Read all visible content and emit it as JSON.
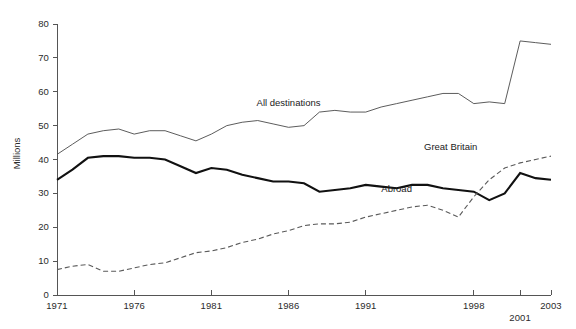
{
  "chart_data": {
    "type": "line",
    "title": "",
    "xlabel": "",
    "ylabel": "Millions",
    "xlim": [
      1971,
      2003
    ],
    "ylim": [
      0,
      80
    ],
    "grid": false,
    "legend_position": "inline-annotations",
    "x": [
      1971,
      1972,
      1973,
      1974,
      1975,
      1976,
      1977,
      1978,
      1979,
      1980,
      1981,
      1982,
      1983,
      1984,
      1985,
      1986,
      1987,
      1988,
      1989,
      1990,
      1991,
      1992,
      1993,
      1994,
      1995,
      1996,
      1997,
      1998,
      1999,
      2000,
      2001,
      2002,
      2003
    ],
    "xticks": [
      1971,
      1976,
      1981,
      1986,
      1991,
      1998,
      2001,
      2003
    ],
    "xticklabels": [
      "1971",
      "1976",
      "1981",
      "1986",
      "1991",
      "1998",
      "2001",
      "2003"
    ],
    "yticks": [
      0,
      10,
      20,
      30,
      40,
      50,
      60,
      70,
      80
    ],
    "yticklabels": [
      "0",
      "10",
      "20",
      "30",
      "40",
      "50",
      "60",
      "70",
      "80"
    ],
    "series": [
      {
        "name": "All destinations",
        "style": "thin-solid",
        "color": "#4a4a4a",
        "values": [
          41.5,
          44.5,
          47.5,
          48.5,
          49.0,
          47.5,
          48.5,
          48.5,
          47.0,
          45.5,
          47.5,
          50.0,
          51.0,
          51.5,
          50.5,
          49.5,
          50.0,
          54.0,
          54.5,
          54.0,
          54.0,
          55.5,
          56.5,
          57.5,
          58.5,
          59.5,
          59.5,
          56.5,
          57.0,
          56.5,
          75.0,
          74.5,
          74.0
        ]
      },
      {
        "name": "Great Britain",
        "style": "thick-solid",
        "color": "#111111",
        "values": [
          34.0,
          37.0,
          40.5,
          41.0,
          41.0,
          40.5,
          40.5,
          40.0,
          38.0,
          36.0,
          37.5,
          37.0,
          35.5,
          34.5,
          33.5,
          33.5,
          33.0,
          30.5,
          31.0,
          31.5,
          32.5,
          32.0,
          31.5,
          32.5,
          32.5,
          31.5,
          31.0,
          30.5,
          28.0,
          30.0,
          36.0,
          34.5,
          34.0
        ]
      },
      {
        "name": "Abroad",
        "style": "dashed",
        "color": "#5a5a5a",
        "values": [
          7.5,
          8.5,
          9.0,
          7.0,
          7.0,
          8.0,
          9.0,
          9.5,
          11.0,
          12.5,
          13.0,
          14.0,
          15.5,
          16.5,
          18.0,
          19.0,
          20.5,
          21.0,
          21.0,
          21.5,
          23.0,
          24.0,
          25.0,
          26.0,
          26.5,
          25.0,
          23.0,
          29.0,
          34.0,
          37.5,
          39.0,
          40.0,
          41.0
        ]
      }
    ],
    "annotations": [
      {
        "text": "All destinations",
        "x": 1986.0,
        "y": 56.5,
        "anchor": "middle"
      },
      {
        "text": "Great Britain",
        "x": 1996.5,
        "y": 43.5,
        "anchor": "middle"
      },
      {
        "text": "Abroad",
        "x": 1993.0,
        "y": 31.0,
        "anchor": "middle"
      }
    ]
  },
  "axes": {
    "y_title": "Millions"
  }
}
